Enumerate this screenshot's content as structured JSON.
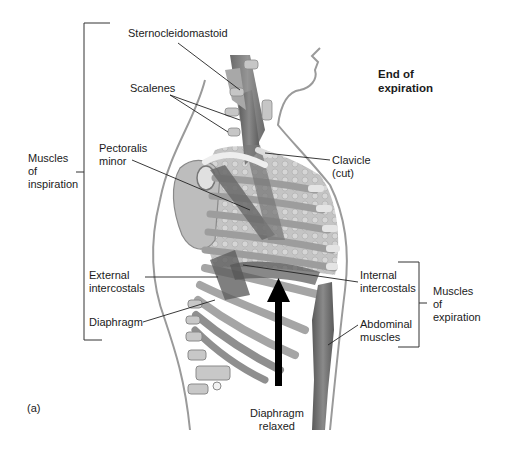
{
  "figure": {
    "panel_label": "(a)",
    "state_title": [
      "End of",
      "expiration"
    ]
  },
  "groups": {
    "inspiration": {
      "label": [
        "Muscles",
        "of",
        "inspiration"
      ]
    },
    "expiration": {
      "label": [
        "Muscles",
        "of",
        "expiration"
      ]
    }
  },
  "labels": {
    "sternocleidomastoid": [
      "Sternocleidomastoid"
    ],
    "scalenes": [
      "Scalenes"
    ],
    "pectoralis_minor": [
      "Pectoralis",
      "minor"
    ],
    "clavicle": [
      "Clavicle",
      "(cut)"
    ],
    "external_intercostals": [
      "External",
      "intercostals"
    ],
    "diaphragm": [
      "Diaphragm"
    ],
    "internal_intercostals": [
      "Internal",
      "intercostals"
    ],
    "abdominal_muscles": [
      "Abdominal",
      "muscles"
    ],
    "diaphragm_relaxed": [
      "Diaphragm",
      "relaxed"
    ]
  },
  "colors": {
    "muscle": "#6e6e6e",
    "bone": "#d9d9d9",
    "lung": "#bdbdbd",
    "outline": "#8a8a8a",
    "arrow": "#000000"
  }
}
